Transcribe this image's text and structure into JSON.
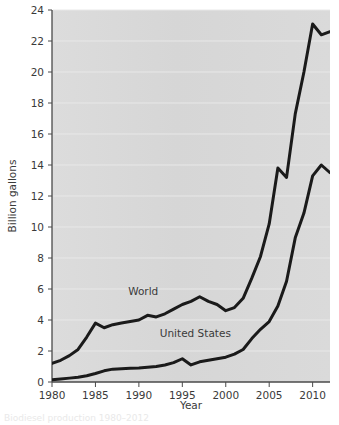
{
  "chart_data": {
    "type": "line",
    "title": "",
    "xlabel": "Year",
    "ylabel": "Billion gallons",
    "xlim": [
      1980,
      2012
    ],
    "ylim": [
      0,
      24
    ],
    "xticks": [
      1980,
      1985,
      1990,
      1995,
      2000,
      2005,
      2010
    ],
    "yticks": [
      0,
      2,
      4,
      6,
      8,
      10,
      12,
      14,
      16,
      18,
      20,
      22,
      24
    ],
    "grid": "horizontal-faint",
    "legend": "inline-labels",
    "x": [
      1980,
      1981,
      1982,
      1983,
      1984,
      1985,
      1986,
      1987,
      1988,
      1989,
      1990,
      1991,
      1992,
      1993,
      1994,
      1995,
      1996,
      1997,
      1998,
      1999,
      2000,
      2001,
      2002,
      2003,
      2004,
      2005,
      2006,
      2007,
      2008,
      2009,
      2010,
      2011,
      2012
    ],
    "series": [
      {
        "name": "World",
        "color": "#1a1a1a",
        "values": [
          1.2,
          1.4,
          1.7,
          2.1,
          2.9,
          3.8,
          3.5,
          3.7,
          3.8,
          3.9,
          4.0,
          4.3,
          4.2,
          4.4,
          4.7,
          5.0,
          5.2,
          5.5,
          5.2,
          5.0,
          4.6,
          4.8,
          5.4,
          6.7,
          8.1,
          10.2,
          13.8,
          13.2,
          17.3,
          20.0,
          23.1,
          22.4,
          22.6
        ]
      },
      {
        "name": "United States",
        "color": "#1a1a1a",
        "values": [
          0.15,
          0.2,
          0.25,
          0.3,
          0.4,
          0.55,
          0.72,
          0.83,
          0.85,
          0.88,
          0.9,
          0.95,
          1.0,
          1.1,
          1.25,
          1.5,
          1.1,
          1.3,
          1.4,
          1.5,
          1.6,
          1.8,
          2.1,
          2.8,
          3.4,
          3.9,
          4.9,
          6.5,
          9.3,
          10.9,
          13.3,
          14.0,
          13.5
        ]
      }
    ],
    "annotations": [
      {
        "text": "World",
        "x": 1990.5,
        "y": 5.6
      },
      {
        "text": "United States",
        "x": 1996.5,
        "y": 2.9
      }
    ]
  },
  "figure": {
    "caption_fragment": "Biodiesel production 1980–2012"
  }
}
